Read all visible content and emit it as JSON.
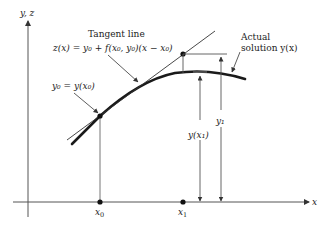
{
  "diagram": {
    "type": "euler-method-tangent-line",
    "axes": {
      "y_label": "y, z",
      "x_label": "x"
    },
    "points": {
      "x0_label": "x",
      "x0_sub": "0",
      "x1_label": "x",
      "x1_sub": "1"
    },
    "annotations": {
      "tangent_title": "Tangent line",
      "tangent_equation": "z(x) = y₀ + f(x₀, y₀)(x − x₀)",
      "initial_condition": "y₀ = y(x₀)",
      "actual_line1": "Actual",
      "actual_line2": "solution y(x)",
      "y_of_x1": "y(x₁)",
      "y1": "y₁"
    },
    "colors": {
      "line": "#222222",
      "axis": "#555555",
      "background": "#ffffff"
    }
  }
}
